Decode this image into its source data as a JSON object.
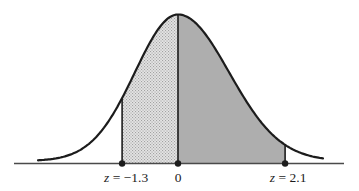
{
  "figure": {
    "background": "#ffffff"
  },
  "chart_data": {
    "type": "area",
    "title": "",
    "xlabel": "",
    "ylabel": "",
    "curve": "standard-normal-density",
    "xlim_z": [
      -3.3,
      2.9
    ],
    "grid": false,
    "curve_color": "#1c1c1c",
    "axis_color": "#4a4a4a",
    "label_color": "#1b1b1b",
    "markers": [
      {
        "z": -1.3,
        "label": "z = −1.3",
        "label_italic": "z",
        "label_plain": "= −1.3"
      },
      {
        "z": 0,
        "label": "0",
        "label_italic": "",
        "label_plain": "0"
      },
      {
        "z": 2.1,
        "label": "z = 2.1",
        "label_italic": "z",
        "label_plain": "= 2.1"
      }
    ],
    "regions": [
      {
        "from_z": -1.3,
        "to_z": 0,
        "fill_style": "stipple",
        "color": "#e4e4e4",
        "dot_color": "#a2a2a2"
      },
      {
        "from_z": 0,
        "to_z": 2.1,
        "fill_style": "solid",
        "color": "#aeaeae"
      }
    ]
  }
}
